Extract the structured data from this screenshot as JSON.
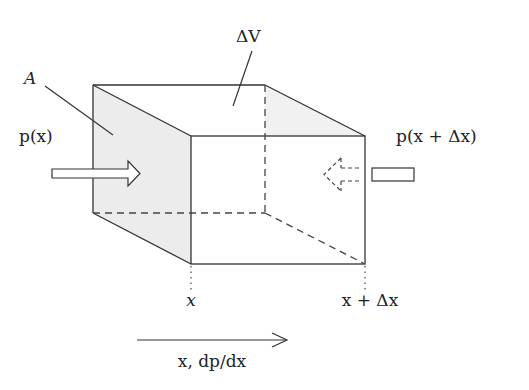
{
  "diagram": {
    "labels": {
      "area": "A",
      "volume": "ΔV",
      "pressure_left": "p(x)",
      "pressure_right": "p(x + Δx)",
      "position_left": "x",
      "position_right": "x + Δx",
      "axis": "x,  dp/dx"
    },
    "colors": {
      "stroke": "#333333",
      "face_fill": "#ececec",
      "background": "#ffffff"
    },
    "box": {
      "back_face": {
        "x1": 93,
        "y1": 85,
        "x2": 265,
        "y2": 213
      },
      "front_face": {
        "x1": 191,
        "y1": 136,
        "x2": 365,
        "y2": 264
      }
    }
  }
}
